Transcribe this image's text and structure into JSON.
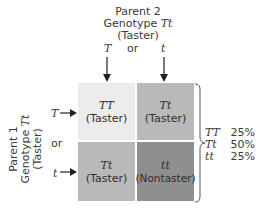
{
  "parent2": {
    "line1": "Parent 2",
    "line2_prefix": "Genotype ",
    "line2_genotype": "Tt",
    "line3": "(Taster)",
    "allele_left": "T",
    "or": "or",
    "allele_right": "t"
  },
  "parent1": {
    "line1": "Parent 1",
    "line2_prefix": "Genotype ",
    "line2_genotype": "Tt",
    "line3": "(Taster)",
    "allele_top": "T",
    "or": "or",
    "allele_bottom": "t"
  },
  "grid": {
    "cells": [
      {
        "genotype": "TT",
        "phenotype": "(Taster)",
        "color": "#ececec"
      },
      {
        "genotype": "Tt",
        "phenotype": "(Taster)",
        "color": "#b9b9b9"
      },
      {
        "genotype": "Tt",
        "phenotype": "(Taster)",
        "color": "#b9b9b9"
      },
      {
        "genotype": "tt",
        "phenotype": "(Nontaster)",
        "color": "#8f8f8f"
      }
    ]
  },
  "ratios": [
    {
      "genotype": "TT",
      "percent": "25%"
    },
    {
      "genotype": "Tt",
      "percent": "50%"
    },
    {
      "genotype": "tt",
      "percent": "25%"
    }
  ]
}
